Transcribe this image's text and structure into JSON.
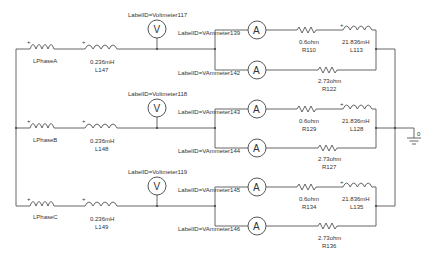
{
  "diagram": {
    "type": "three-phase circuit schematic",
    "phases": [
      {
        "source": {
          "name": "LPhaseA"
        },
        "line_inductor": {
          "value": "0.236mH",
          "name": "L147"
        },
        "voltmeter": {
          "label": "LabelID=Voltmeter117",
          "symbol": "V"
        },
        "branch_upper": {
          "ammeter": {
            "label": "LabelID=VAmmeter139",
            "symbol": "A"
          },
          "resistor": {
            "value": "0.6ohm",
            "name": "R110"
          },
          "inductor": {
            "value": "21.836mH",
            "name": "L113"
          }
        },
        "branch_lower": {
          "ammeter": {
            "label": "LabelID=VAmmeter142",
            "symbol": "A"
          },
          "resistor": {
            "value": "2.73ohm",
            "name": "R122"
          }
        }
      },
      {
        "source": {
          "name": "LPhaseB"
        },
        "line_inductor": {
          "value": "0.236mH",
          "name": "L148"
        },
        "voltmeter": {
          "label": "LabelID=Voltmeter118",
          "symbol": "V"
        },
        "branch_upper": {
          "ammeter": {
            "label": "LabelID=VAmmeter143",
            "symbol": "A"
          },
          "resistor": {
            "value": "0.6ohm",
            "name": "R129"
          },
          "inductor": {
            "value": "21.836mH",
            "name": "L128"
          }
        },
        "branch_lower": {
          "ammeter": {
            "label": "LabelID=VAmmeter144",
            "symbol": "A"
          },
          "resistor": {
            "value": "2.73ohm",
            "name": "R127"
          }
        }
      },
      {
        "source": {
          "name": "LPhaseC"
        },
        "line_inductor": {
          "value": "0.236mH",
          "name": "L149"
        },
        "voltmeter": {
          "label": "LabelID=Voltmeter119",
          "symbol": "V"
        },
        "branch_upper": {
          "ammeter": {
            "label": "LabelID=VAmmeter145",
            "symbol": "A"
          },
          "resistor": {
            "value": "0.6ohm",
            "name": "R134"
          },
          "inductor": {
            "value": "21.836mH",
            "name": "L135"
          }
        },
        "branch_lower": {
          "ammeter": {
            "label": "LabelID=VAmmeter146",
            "symbol": "A"
          },
          "resistor": {
            "value": "2.73ohm",
            "name": "R136"
          }
        }
      }
    ],
    "ground": {
      "label": "0"
    },
    "polarity_mark": "+"
  }
}
